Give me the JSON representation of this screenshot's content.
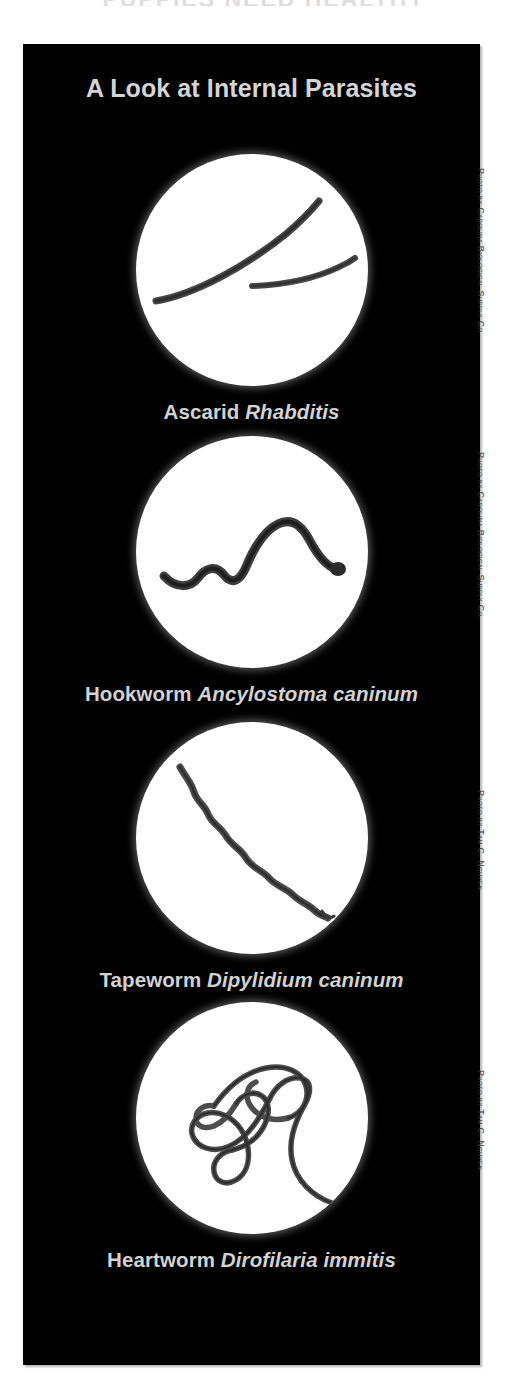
{
  "page": {
    "bleed_headline": "PUPPIES  NEED  HEALTHY",
    "background_color": "#ffffff",
    "panel_color": "#000000",
    "text_color": "#d3d3d3",
    "credit_color": "#3a3a3a"
  },
  "panel": {
    "title": "A Look at Internal Parasites"
  },
  "figures": [
    {
      "common_name": "Ascarid",
      "scientific_name": "Rhabditis",
      "image_alt": "ascarid-roundworm-micrograph",
      "credit": "Photo by Carolina Biological Supply Co."
    },
    {
      "common_name": "Hookworm",
      "scientific_name": "Ancylostoma caninum",
      "image_alt": "hookworm-micrograph",
      "credit": "Photo by Carolina Biological Supply Co."
    },
    {
      "common_name": "Tapeworm",
      "scientific_name": "Dipylidium caninum",
      "image_alt": "tapeworm-micrograph",
      "credit": "Photo by Tam C. Nguyen."
    },
    {
      "common_name": "Heartworm",
      "scientific_name": "Dirofilaria immitis",
      "image_alt": "heartworm-micrograph",
      "credit": "Photo by Tam C. Nguyen."
    }
  ]
}
